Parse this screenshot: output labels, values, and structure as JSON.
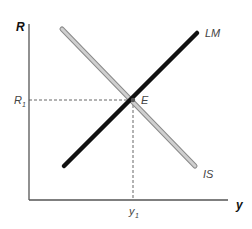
{
  "diagram": {
    "type": "IS-LM",
    "axes": {
      "y_axis_label": "R",
      "x_axis_label": "y"
    },
    "curves": [
      {
        "name": "LM",
        "label": "LM",
        "color": "#111111",
        "style": "thick-solid"
      },
      {
        "name": "IS",
        "label": "IS",
        "color": "#b0b0b0",
        "style": "outlined-gray"
      }
    ],
    "equilibrium": {
      "label": "E",
      "r_label_base": "R",
      "r_label_sub": "1",
      "y_label_base": "y",
      "y_label_sub": "1"
    },
    "colors": {
      "axis": "#555555",
      "dashed": "#555555",
      "lm": "#111111",
      "is_fill": "#c8c8c8",
      "is_outline": "#8a8a8a"
    }
  }
}
